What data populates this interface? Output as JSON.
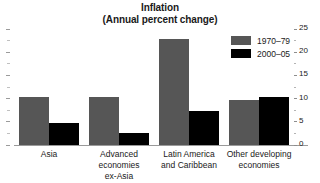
{
  "chart_data": {
    "type": "bar",
    "title": "Inflation",
    "subtitle": "(Annual percent change)",
    "xlabel": "",
    "ylabel": "",
    "ylim": [
      0,
      25
    ],
    "y_axis_position": "right",
    "grid": false,
    "legend_position": "top-right",
    "categories": [
      "Asia",
      "Advanced economies ex-Asia",
      "Latin America and Caribbean",
      "Other developing economies"
    ],
    "category_lines": [
      [
        "Asia"
      ],
      [
        "Advanced economies",
        "ex-Asia"
      ],
      [
        "Latin America",
        "and Caribbean"
      ],
      [
        "Other developing",
        "economies"
      ]
    ],
    "series": [
      {
        "name": "1970–79",
        "color": "#565656",
        "values": [
          10.3,
          10.3,
          22.8,
          9.7
        ]
      },
      {
        "name": "2000–05",
        "color": "#000000",
        "values": [
          4.7,
          2.6,
          7.3,
          10.3
        ]
      }
    ],
    "y_ticks": [
      0,
      5,
      10,
      15,
      20,
      25
    ],
    "y_tick_labels": [
      "0",
      "5",
      "10",
      "15",
      "20",
      "25"
    ],
    "y_minor_ticks": [
      2.5,
      7.5,
      12.5,
      17.5,
      22.5
    ]
  },
  "colors": {
    "series_1970s": "#565656",
    "series_2000s": "#000000",
    "axis": "#9a9a9a",
    "text": "#1a1a1a",
    "background": "#ffffff"
  }
}
